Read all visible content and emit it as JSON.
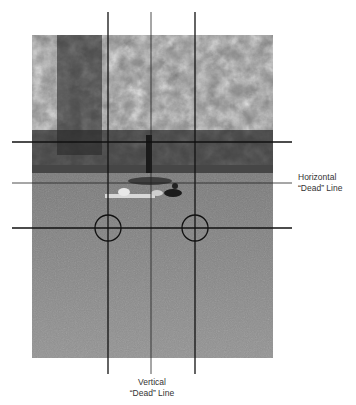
{
  "figure": {
    "photo_description": "Park scene with trees in background and people lying on a grass lawn",
    "labels": {
      "horizontal": {
        "line1": "Horizontal",
        "line2": "“Dead” Line"
      },
      "vertical": {
        "line1": "Vertical",
        "line2": "“Dead” Line"
      }
    },
    "guides": {
      "vertical_x": [
        108,
        151,
        195
      ],
      "horizontal_y": [
        142,
        183,
        228
      ],
      "center_horizontal_y": 183,
      "center_vertical_x": 151,
      "circles": [
        {
          "cx": 108,
          "cy": 228,
          "r": 13
        },
        {
          "cx": 195,
          "cy": 228,
          "r": 13
        }
      ]
    },
    "colors": {
      "line": "#111111",
      "text": "#333333",
      "background": "#ffffff"
    }
  }
}
